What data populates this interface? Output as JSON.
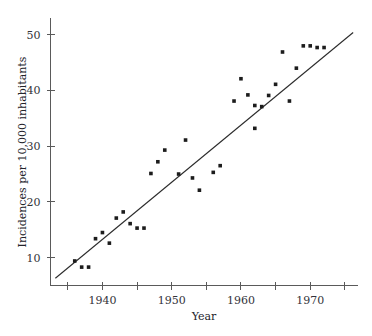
{
  "chart_data": {
    "type": "scatter",
    "title": "",
    "xlabel": "Year",
    "ylabel": "Incidences per 10,000 inhabitants",
    "xlim": [
      1932.5,
      1976.9
    ],
    "ylim": [
      5.0,
      53.0
    ],
    "grid": false,
    "legend": null,
    "x_ticks_major": [
      1940,
      1950,
      1960,
      1970
    ],
    "x_tick_labels": [
      "1940",
      "1950",
      "1960",
      "1970"
    ],
    "x_ticks_minor": [
      1935,
      1945,
      1955,
      1965,
      1975
    ],
    "y_ticks_major": [
      10,
      20,
      30,
      40,
      50
    ],
    "y_tick_labels": [
      "10",
      "20",
      "30",
      "40",
      "50"
    ],
    "series": [
      {
        "name": "Incidences",
        "marker": "square",
        "color": "#1c1c1c",
        "x": [
          1936,
          1937,
          1938,
          1939,
          1940,
          1941,
          1942,
          1943,
          1944,
          1945,
          1946,
          1947,
          1948,
          1949,
          1951,
          1952,
          1953,
          1954,
          1956,
          1957,
          1959,
          1960,
          1961,
          1962,
          1962,
          1963,
          1964,
          1965,
          1966,
          1967,
          1968,
          1969,
          1970,
          1971,
          1972
        ],
        "y": [
          9.4,
          8.3,
          8.3,
          13.4,
          14.5,
          12.6,
          17.1,
          18.2,
          16.1,
          15.3,
          15.3,
          25.1,
          27.2,
          29.3,
          25.0,
          31.1,
          24.3,
          22.1,
          25.3,
          26.5,
          38.1,
          42.1,
          39.2,
          37.3,
          33.2,
          37.1,
          39.1,
          41.1,
          46.9,
          38.1,
          44.0,
          48.0,
          48.0,
          47.7,
          47.7
        ]
      }
    ],
    "fit_line": {
      "name": "least-squares fit",
      "color": "#2b2b2b",
      "x_start": 1933.2,
      "y_start": 6.3,
      "x_end": 1976.2,
      "y_end": 50.4
    }
  },
  "axes": {
    "x_title": "Year",
    "y_title": "Incidences per 10,000 inhabitants"
  }
}
